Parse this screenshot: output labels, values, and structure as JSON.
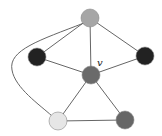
{
  "diagram": {
    "type": "graph",
    "nodes": [
      {
        "id": "top",
        "x": 90,
        "y": 18,
        "fill": "#a6a6a6"
      },
      {
        "id": "left",
        "x": 37,
        "y": 57,
        "fill": "#222222"
      },
      {
        "id": "right",
        "x": 145,
        "y": 56,
        "fill": "#222222"
      },
      {
        "id": "v",
        "x": 91,
        "y": 75,
        "fill": "#6a6a6a",
        "label": "v"
      },
      {
        "id": "bottom-left",
        "x": 58,
        "y": 121,
        "fill": "#e6e6e6"
      },
      {
        "id": "bottom-right",
        "x": 125,
        "y": 120,
        "fill": "#666666"
      }
    ],
    "edges": [
      [
        "top",
        "left"
      ],
      [
        "top",
        "right"
      ],
      [
        "top",
        "v"
      ],
      [
        "left",
        "v"
      ],
      [
        "right",
        "v"
      ],
      [
        "v",
        "bottom-left"
      ],
      [
        "v",
        "bottom-right"
      ],
      [
        "bottom-left",
        "bottom-right"
      ],
      [
        "top",
        "bottom-left"
      ]
    ],
    "center_label": "v"
  }
}
